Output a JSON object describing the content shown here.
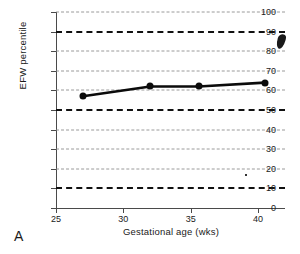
{
  "panel": {
    "label": "A"
  },
  "chart_data": {
    "type": "line",
    "title": "",
    "xlabel": "Gestational age (wks)",
    "ylabel": "EFW percentile",
    "xlim": [
      25,
      42
    ],
    "ylim": [
      0,
      100
    ],
    "xticks": [
      25,
      30,
      35,
      40
    ],
    "yticks": [
      0,
      10,
      20,
      30,
      40,
      50,
      60,
      70,
      80,
      90,
      100
    ],
    "grid": false,
    "legend": "none",
    "series": [
      {
        "name": "EFW percentile trajectory",
        "marker": "filled-circle",
        "x": [
          27.0,
          32.0,
          35.6,
          40.5
        ],
        "values": [
          57,
          62,
          62,
          64
        ]
      }
    ],
    "reference_lines": [
      {
        "label": "90th percentile",
        "y": 90,
        "style": "bold-dashed"
      },
      {
        "label": "50th percentile",
        "y": 50,
        "style": "bold-dashed"
      },
      {
        "label": "10th percentile",
        "y": 10,
        "style": "bold-dashed"
      },
      {
        "label": "",
        "y": 100,
        "style": "light-dashed"
      },
      {
        "label": "",
        "y": 80,
        "style": "light-dashed"
      },
      {
        "label": "",
        "y": 70,
        "style": "light-dashed"
      },
      {
        "label": "",
        "y": 60,
        "style": "light-dashed"
      },
      {
        "label": "",
        "y": 40,
        "style": "light-dashed"
      },
      {
        "label": "",
        "y": 30,
        "style": "light-dashed"
      },
      {
        "label": "",
        "y": 20,
        "style": "light-dashed"
      }
    ],
    "colors": {
      "series": "#0b0b0b",
      "major_reference": "#111111",
      "minor_reference": "#8a8a8a",
      "axis": "#4a4a4a"
    }
  }
}
